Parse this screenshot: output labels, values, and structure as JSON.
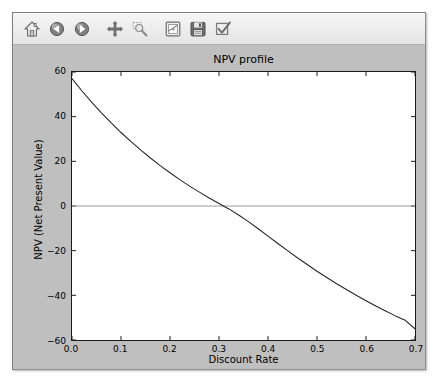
{
  "window": {
    "title": "NPV profile"
  },
  "toolbar": {
    "buttons": [
      {
        "name": "home-icon",
        "label": "Home",
        "tooltip": "Reset original view"
      },
      {
        "name": "back-arrow-icon",
        "label": "Back",
        "tooltip": "Back to previous view"
      },
      {
        "name": "forward-arrow-icon",
        "label": "Forward",
        "tooltip": "Forward to next view"
      },
      {
        "name": "pan-move-icon",
        "label": "Pan",
        "tooltip": "Pan axes with left mouse, zoom with right"
      },
      {
        "name": "zoom-rect-icon",
        "label": "Zoom",
        "tooltip": "Zoom to rectangle"
      },
      {
        "name": "subplot-config-icon",
        "label": "Subplots",
        "tooltip": "Configure subplots"
      },
      {
        "name": "save-disk-icon",
        "label": "Save",
        "tooltip": "Save the figure"
      },
      {
        "name": "edit-check-icon",
        "label": "Edit",
        "tooltip": "Edit curves line and axes parameters"
      }
    ]
  },
  "chart_data": {
    "type": "line",
    "title": "NPV profile",
    "xlabel": "Discount Rate",
    "ylabel": "NPV (Net Present Value)",
    "xlim": [
      0.0,
      0.7
    ],
    "ylim": [
      -60,
      60
    ],
    "xticks": [
      0.0,
      0.1,
      0.2,
      0.3,
      0.4,
      0.5,
      0.6,
      0.7
    ],
    "xticklabels": [
      "0.0",
      "0.1",
      "0.2",
      "0.3",
      "0.4",
      "0.5",
      "0.6",
      "0.7"
    ],
    "yticks": [
      60,
      40,
      20,
      0,
      -20,
      -40,
      -60
    ],
    "yticklabels": [
      "60",
      "40",
      "20",
      "0",
      "-20",
      "-40",
      "-60"
    ],
    "grid": false,
    "zero_line": true,
    "zero_line_color": "#999999",
    "legend": null,
    "line_color": "#262626",
    "line_width": 1,
    "irr_crossing": 0.215,
    "x": [
      0.0,
      0.02,
      0.04,
      0.06,
      0.08,
      0.1,
      0.12,
      0.14,
      0.16,
      0.18,
      0.2,
      0.22,
      0.24,
      0.26,
      0.28,
      0.3,
      0.32,
      0.34,
      0.36,
      0.38,
      0.4,
      0.42,
      0.44,
      0.46,
      0.48,
      0.5,
      0.52,
      0.54,
      0.56,
      0.58,
      0.6,
      0.62,
      0.64,
      0.66,
      0.68,
      0.7
    ],
    "y": [
      57.0,
      51.6,
      46.5,
      41.7,
      37.2,
      32.9,
      28.9,
      25.1,
      21.5,
      18.1,
      14.9,
      11.8,
      8.9,
      6.2,
      3.6,
      1.1,
      -1.3,
      -3.5,
      -5.6,
      -7.6,
      -9.5,
      -11.3,
      -13.1,
      -14.8,
      -16.4,
      -18.0,
      -19.5,
      -21.0,
      -22.4,
      -23.8,
      -25.1,
      -26.4,
      -27.6,
      -28.8,
      -29.9,
      -31.0
    ],
    "y_display": [
      57.0,
      51.6,
      46.5,
      41.7,
      37.2,
      32.9,
      28.9,
      25.1,
      21.5,
      18.1,
      14.9,
      11.8,
      8.9,
      6.2,
      3.6,
      1.1,
      -1.3,
      -4.0,
      -7.0,
      -10.2,
      -13.5,
      -16.8,
      -20.0,
      -23.2,
      -26.2,
      -29.2,
      -32.0,
      -34.8,
      -37.4,
      -40.0,
      -42.4,
      -44.8,
      -47.0,
      -49.2,
      -51.2,
      -55.0
    ]
  }
}
